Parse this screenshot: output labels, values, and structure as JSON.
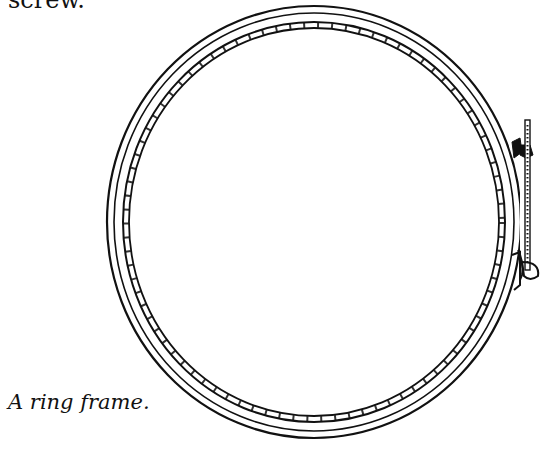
{
  "document": {
    "preceding_text_fragment": "screw.",
    "figure": {
      "subject": "ring-frame-illustration",
      "caption": "A ring frame."
    }
  }
}
